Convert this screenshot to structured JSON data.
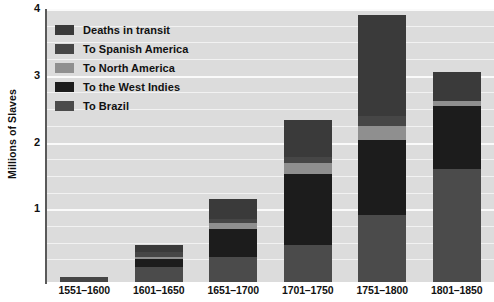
{
  "chart_data": {
    "type": "bar",
    "stacked": true,
    "title": "",
    "xlabel": "",
    "ylabel": "Millions of Slaves",
    "ylim": [
      0,
      4
    ],
    "yticks": [
      1,
      2,
      3,
      4
    ],
    "ytick_labels": [
      "1",
      "2",
      "3",
      "4"
    ],
    "minor_gridline_step": 0.25,
    "grid": true,
    "legend_position": "upper-left-inside",
    "categories": [
      "1551–1600",
      "1601–1650",
      "1651–1700",
      "1701–1750",
      "1751–1800",
      "1801–1850"
    ],
    "series": [
      {
        "name": "To Brazil",
        "color": "#4b4b4b",
        "values": [
          0.0,
          0.22,
          0.37,
          0.56,
          1.0,
          1.7
        ]
      },
      {
        "name": "To the West Indies",
        "color": "#1c1c1c",
        "values": [
          0.0,
          0.12,
          0.42,
          1.06,
          1.13,
          0.93
        ]
      },
      {
        "name": "To North America",
        "color": "#8f8f8f",
        "values": [
          0.0,
          0.03,
          0.09,
          0.17,
          0.21,
          0.08
        ]
      },
      {
        "name": "To Spanish America",
        "color": "#464646",
        "values": [
          0.08,
          0.08,
          0.07,
          0.09,
          0.15,
          0.0
        ]
      },
      {
        "name": "Deaths in transit",
        "color": "#3a3a3a",
        "values": [
          0.0,
          0.11,
          0.29,
          0.54,
          1.51,
          0.44
        ]
      }
    ],
    "totals": [
      0.08,
      0.56,
      1.24,
      2.42,
      4.0,
      3.15
    ],
    "stack_order_top_to_bottom": [
      "Deaths in transit",
      "To Spanish America",
      "To North America",
      "To the West Indies",
      "To Brazil"
    ]
  },
  "axis": {
    "y_title": "Millions of Slaves",
    "y_tick_labels": [
      "4",
      "3",
      "2",
      "1"
    ],
    "x_tick_labels": [
      "1551–1600",
      "1601–1650",
      "1651–1700",
      "1701–1750",
      "1751–1800",
      "1801–1850"
    ]
  },
  "legend": {
    "items": [
      {
        "label": "Deaths in transit",
        "swatch": "#3a3a3a",
        "icon": "legend-swatch"
      },
      {
        "label": "To Spanish America",
        "swatch": "#464646",
        "icon": "legend-swatch"
      },
      {
        "label": "To North America",
        "swatch": "#8f8f8f",
        "icon": "legend-swatch"
      },
      {
        "label": "To the West Indies",
        "swatch": "#1c1c1c",
        "icon": "legend-swatch"
      },
      {
        "label": "To Brazil",
        "swatch": "#4b4b4b",
        "icon": "legend-swatch"
      }
    ]
  },
  "colors": {
    "plot_background": "#dcdcdc",
    "page_background": "#ffffff",
    "gridline": "#f2f2f2",
    "gridline_major": "#fafafa",
    "axis_line": "#5a5a5a",
    "text": "#111111"
  }
}
